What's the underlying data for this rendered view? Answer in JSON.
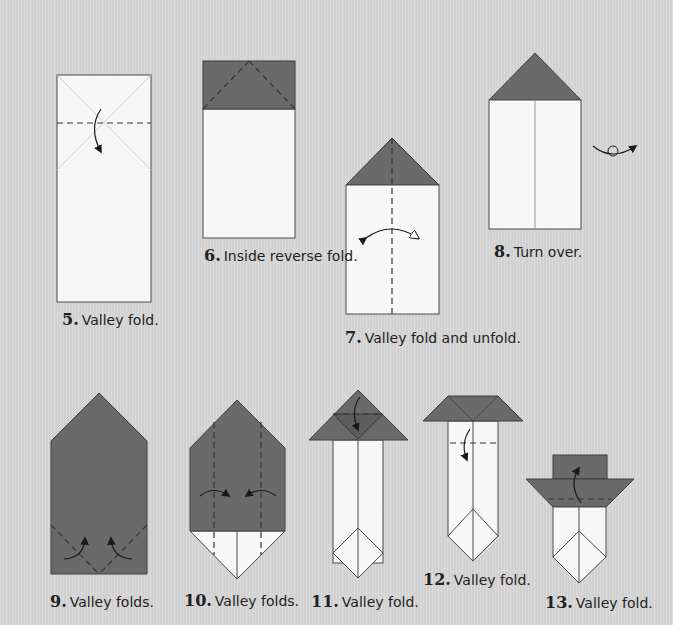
{
  "steps": [
    {
      "number": "5.",
      "caption": "Valley fold."
    },
    {
      "number": "6.",
      "caption": "Inside reverse fold."
    },
    {
      "number": "7.",
      "caption": "Valley fold and unfold."
    },
    {
      "number": "8.",
      "caption": "Turn over."
    },
    {
      "number": "9.",
      "caption": "Valley folds."
    },
    {
      "number": "10.",
      "caption": "Valley folds."
    },
    {
      "number": "11.",
      "caption": "Valley fold."
    },
    {
      "number": "12.",
      "caption": "Valley fold."
    },
    {
      "number": "13.",
      "caption": "Valley fold."
    }
  ],
  "colors": {
    "background": "#d8d8d8",
    "paper_white": "#f7f7f7",
    "paper_colored": "#6a6a6a",
    "outline": "#4a4a4a"
  },
  "icons": {
    "valley_fold_arrow": "curved-arrow-solid-head",
    "unfold_arrow": "curved-arrow-hollow-head",
    "turn_over": "turn-over-loop-arrow"
  }
}
